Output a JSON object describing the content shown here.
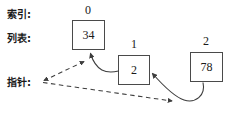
{
  "diagram": {
    "row_labels": {
      "index": "索引:",
      "list": "列表:",
      "pointer": "指针:"
    },
    "indices": [
      "0",
      "1",
      "2"
    ],
    "nodes": [
      {
        "index": "0",
        "value": "34"
      },
      {
        "index": "1",
        "value": "2"
      },
      {
        "index": "2",
        "value": "78"
      }
    ],
    "colors": {
      "stroke": "#4a4a4a",
      "box_border": "#4a4a4a",
      "text": "#1a1a1a",
      "background": "#ffffff"
    },
    "connectors": [
      {
        "name": "node1-to-node0",
        "style": "solid",
        "from": "2",
        "to": "34"
      },
      {
        "name": "node2-to-node1",
        "style": "solid",
        "from": "78",
        "to": "2"
      },
      {
        "name": "pointer-to-node0",
        "style": "dashed",
        "from": "指针:",
        "to": "34"
      },
      {
        "name": "pointer-to-node2-area",
        "style": "dashed",
        "from": "指针:",
        "to": "78"
      }
    ]
  }
}
